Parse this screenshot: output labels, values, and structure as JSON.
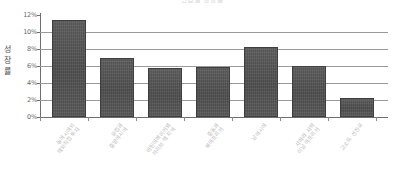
{
  "chart_data": {
    "type": "bar",
    "title": "산업별 성장률",
    "xlabel": "",
    "ylabel": "성장률",
    "ylabel_chars": [
      "성",
      "장",
      "률"
    ],
    "ylim": [
      0,
      12
    ],
    "ytick_labels": [
      "12%",
      "10%",
      "8%",
      "6%",
      "4%",
      "2%",
      "0%"
    ],
    "ytick_values": [
      12,
      10,
      8,
      6,
      4,
      2,
      0
    ],
    "grid": true,
    "legend": "none",
    "categories": [
      "동아시아의 해외직접 투자",
      "유럽과 중앙아시아",
      "라틴아메리카와 카리브 해 지역",
      "중동과 북아프리카",
      "남아시아",
      "사하라 사막 이남 아프리카",
      "고소득 선진국"
    ],
    "category_lines": [
      [
        "동아시아의",
        "해외직접 투자"
      ],
      [
        "유럽과",
        "중앙아시아"
      ],
      [
        "라틴아메리카와",
        "카리브 해 지역"
      ],
      [
        "중동과",
        "북아프리카"
      ],
      [
        "남아시아"
      ],
      [
        "사하라 사막",
        "이남 아프리카"
      ],
      [
        "고소득 선진국"
      ]
    ],
    "values": [
      11.4,
      6.9,
      5.8,
      5.9,
      8.2,
      6.0,
      2.3
    ],
    "value_unit": "%",
    "bar_color": "#555555",
    "grid_color": "#9a9a9a",
    "axis_color": "#6f6f6f"
  }
}
